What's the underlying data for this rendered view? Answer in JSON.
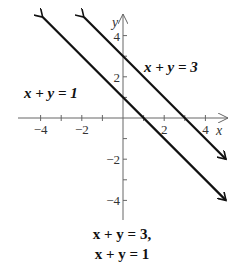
{
  "chart_data": {
    "type": "line",
    "title": "",
    "xlabel": "x",
    "ylabel": "y",
    "xlim": [
      -5,
      5
    ],
    "ylim": [
      -5,
      5
    ],
    "x_ticks": [
      -4,
      -3,
      -2,
      -1,
      1,
      2,
      3,
      4
    ],
    "y_ticks": [
      -4,
      -3,
      -2,
      -1,
      1,
      2,
      3,
      4
    ],
    "x_tick_labels": [
      {
        "value": -4,
        "label": "−4"
      },
      {
        "value": -2,
        "label": "−2"
      },
      {
        "value": 2,
        "label": "2"
      },
      {
        "value": 4,
        "label": "4"
      }
    ],
    "y_tick_labels": [
      {
        "value": 4,
        "label": "4"
      },
      {
        "value": 2,
        "label": "2"
      },
      {
        "value": -2,
        "label": "−2"
      },
      {
        "value": -4,
        "label": "−4"
      }
    ],
    "grid": false,
    "series": [
      {
        "name": "x + y = 1",
        "equation": "x + y = 1",
        "x": [
          -3.9,
          5.0
        ],
        "y": [
          4.9,
          -4.0
        ],
        "arrows": "both"
      },
      {
        "name": "x + y = 3",
        "equation": "x + y = 3",
        "x": [
          -1.9,
          5.0
        ],
        "y": [
          4.9,
          -2.0
        ],
        "arrows": "both"
      }
    ],
    "annotations": [
      {
        "text": "x + y = 1",
        "near_series": "x + y = 1",
        "position": "left"
      },
      {
        "text": "x + y = 3",
        "near_series": "x + y = 3",
        "position": "right"
      }
    ]
  },
  "caption": {
    "line1": "x + y = 3,",
    "line2": "x + y = 1"
  }
}
